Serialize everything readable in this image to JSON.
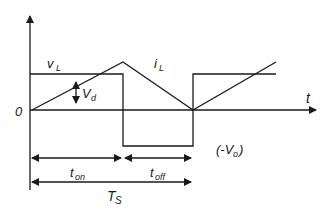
{
  "diagram": {
    "labels": {
      "origin": "0",
      "time_axis": "t",
      "vL_main": "v",
      "vL_sub": "L",
      "iL_main": "i",
      "iL_sub": "L",
      "vd_main": "V",
      "vd_sub": "d",
      "neg_open": "(-V",
      "neg_sub": "o",
      "neg_close": ")",
      "ton_main": "t",
      "ton_sub": "on",
      "toff_main": "t",
      "toff_sub": "off",
      "ts_main": "T",
      "ts_sub": "S"
    },
    "colors": {
      "line": "#1a1a1a",
      "background": "#ffffff"
    },
    "waveforms": {
      "vL": {
        "name": "inductor voltage",
        "levels": [
          "Vd (high during ton)",
          "-Vo (low during toff)"
        ]
      },
      "iL": {
        "name": "inductor current",
        "shape": "triangular ramp: rises during ton, falls during toff"
      }
    }
  }
}
